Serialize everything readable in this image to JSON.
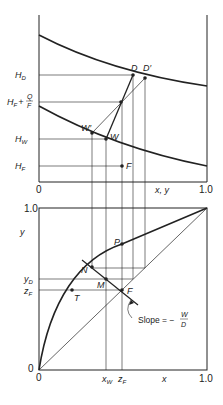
{
  "upper_panel": {
    "y_labels": {
      "hd": "H",
      "hd_sub": "D",
      "hfq": "H",
      "hfq_sub": "F",
      "hfq_plus": "+",
      "hfq_num": "Q",
      "hfq_den": "F",
      "hw": "H",
      "hw_sub": "W",
      "hf": "H",
      "hf_sub": "F"
    },
    "x_origin": "0",
    "x_end": "1.0",
    "x_axis_label": "x, y",
    "points": {
      "d": "D",
      "d_prime": "D′",
      "w": "W",
      "w_prime": "W′",
      "f": "F"
    }
  },
  "lower_panel": {
    "y_top": "1.0",
    "y_origin": "0",
    "y_axis_label": "y",
    "y_labels": {
      "yd": "y",
      "yd_sub": "D",
      "zf": "z",
      "zf_sub": "F"
    },
    "x_origin": "0",
    "x_end": "1.0",
    "x_axis_label": "x",
    "x_labels": {
      "xw": "x",
      "xw_sub": "W",
      "zf": "z",
      "zf_sub": "F"
    },
    "points": {
      "p": "P",
      "n": "N",
      "m": "M",
      "f": "F",
      "t": "T"
    },
    "slope_annotation": {
      "text": "Slope = −",
      "num": "W",
      "den": "D"
    }
  },
  "colors": {
    "line": "#222222",
    "background": "#ffffff"
  }
}
